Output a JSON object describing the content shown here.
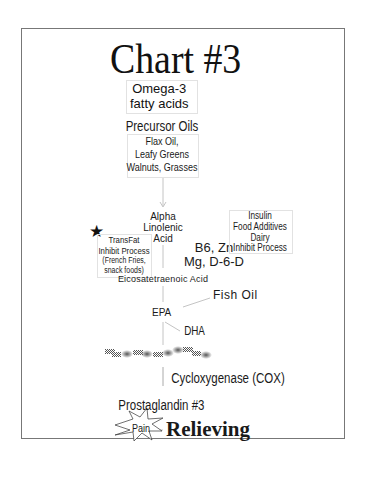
{
  "title": "Chart #3",
  "nodes": {
    "omega3": "Omega-3\nfatty acids",
    "precursor_oils": "Precursor Oils",
    "precursor_sources": "Flax Oil,\nLeafy Greens\nWalnuts, Grasses",
    "alpha_linolenic": "Alpha\nLinolenic\nAcid",
    "transfat": "TransFat\nInhibit Process",
    "transfat_examples": "(French Fries,\nsnack foods)",
    "cofactors": "B6, Zn\nMg, D-6-D",
    "inhibitors": "Insulin\nFood Additives\nDairy\nInhibit Process",
    "eicosatetraenoic": "Eicosatetraenoic Acid",
    "fish_oil": "Fish Oil",
    "epa": "EPA",
    "dha": "DHA",
    "cox": "Cycloxygenase (COX)",
    "prostaglandin": "Prostaglandin #3",
    "pain": "Pain",
    "relieving": "Relieving"
  },
  "icons": {
    "star": "★"
  },
  "colors": {
    "frame": "#777777",
    "connector": "#bbbbbb",
    "text": "#1a1a1a"
  }
}
